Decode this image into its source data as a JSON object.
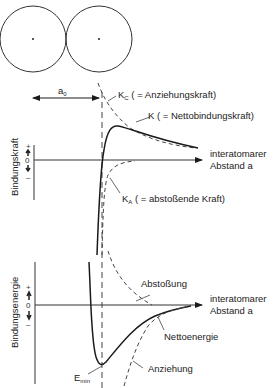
{
  "atoms": {
    "left_atom": {
      "cx": 33,
      "cy": 39,
      "r": 33
    },
    "right_atom": {
      "cx": 99,
      "cy": 39,
      "r": 33
    }
  },
  "equilibrium": {
    "label": "a",
    "label_sub": "0"
  },
  "force_plot": {
    "y_axis_label": "Bindungskraft",
    "tick_plus": "+",
    "tick_zero": "0",
    "tick_minus": "–",
    "x_axis_label_line1": "interatomarer",
    "x_axis_label_line2": "Abstand a",
    "curves": {
      "attractive": {
        "symbol": "K",
        "sub": "C",
        "text": "( = Anziehungskraft)",
        "style": "dashed"
      },
      "net": {
        "symbol": "K",
        "text": "( = Nettobindungskraft)",
        "style": "solid"
      },
      "repulsive": {
        "symbol": "K",
        "sub": "A",
        "text": "( = abstoßende Kraft)",
        "style": "dashed"
      }
    }
  },
  "energy_plot": {
    "y_axis_label": "Bindungsenergie",
    "tick_plus": "+",
    "tick_zero": "0",
    "tick_minus": "–",
    "x_axis_label_line1": "interatomarer",
    "x_axis_label_line2": "Abstand a",
    "curves": {
      "repulsion": {
        "text": "Abstoßung",
        "style": "dashed"
      },
      "net": {
        "text": "Nettoenergie",
        "style": "solid"
      },
      "attraction": {
        "text": "Anziehung",
        "style": "dashed"
      }
    },
    "minimum": {
      "symbol": "E",
      "sub": "min"
    }
  },
  "colors": {
    "line": "#1a1a1a",
    "dashed": "#444444"
  }
}
